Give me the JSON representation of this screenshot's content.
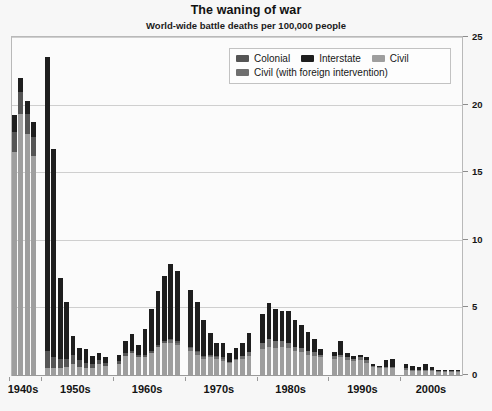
{
  "chart": {
    "title": "The waning of war",
    "subtitle": "World-wide battle deaths per 100,000 people"
  },
  "legend": {
    "rows": [
      [
        {
          "label": "Colonial",
          "color": "#555555",
          "key": "colonial"
        },
        {
          "label": "Interstate",
          "color": "#1e1e1e",
          "key": "interstate"
        },
        {
          "label": "Civil",
          "color": "#9e9e9e",
          "key": "civil"
        }
      ],
      [
        {
          "label": "Civil (with foreign intervention)",
          "color": "#6f6f6f",
          "key": "civil_foreign"
        }
      ]
    ]
  },
  "axes": {
    "y": {
      "min": 0,
      "max": 25,
      "ticks": [
        0,
        5,
        10,
        15,
        20,
        25
      ],
      "tick_labels": [
        "0",
        "5",
        "10",
        "15",
        "20",
        "25"
      ]
    },
    "x": {
      "tick_labels": [
        "1940s",
        "1950s",
        "1960s",
        "1970s",
        "1980s",
        "1990s",
        "2000s"
      ]
    }
  },
  "chart_data": {
    "type": "bar",
    "subtype": "stacked",
    "title": "The waning of war",
    "subtitle": "World-wide battle deaths per 100,000 people",
    "xlabel": "",
    "ylabel": "Battle deaths per 100,000 people",
    "ylim": [
      0,
      25
    ],
    "grid": true,
    "legend_position": "top-right-inside",
    "series": [
      {
        "name": "Colonial",
        "color": "#555555"
      },
      {
        "name": "Interstate",
        "color": "#1e1e1e"
      },
      {
        "name": "Civil",
        "color": "#9e9e9e"
      },
      {
        "name": "Civil (with foreign intervention)",
        "color": "#6f6f6f"
      }
    ],
    "categories": [
      "1946",
      "1947",
      "1948",
      "1949",
      "1950",
      "1951",
      "1952",
      "1953",
      "1954",
      "1955",
      "1956",
      "1957",
      "1958",
      "1959",
      "1960",
      "1961",
      "1962",
      "1963",
      "1964",
      "1965",
      "1966",
      "1967",
      "1968",
      "1969",
      "1970",
      "1971",
      "1972",
      "1973",
      "1974",
      "1975",
      "1976",
      "1977",
      "1978",
      "1979",
      "1980",
      "1981",
      "1982",
      "1983",
      "1984",
      "1985",
      "1986",
      "1987",
      "1988",
      "1989",
      "1990",
      "1991",
      "1992",
      "1993",
      "1994",
      "1995",
      "1996",
      "1997",
      "1998",
      "1999",
      "2000",
      "2001",
      "2002",
      "2003",
      "2004",
      "2005",
      "2006",
      "2007",
      "2008"
    ],
    "decade_groups": [
      {
        "label": "1940s",
        "start_index": 0,
        "count": 4
      },
      {
        "label": "1950s",
        "start_index": 4,
        "count": 10
      },
      {
        "label": "1960s",
        "start_index": 14,
        "count": 10
      },
      {
        "label": "1970s",
        "start_index": 24,
        "count": 10
      },
      {
        "label": "1980s",
        "start_index": 34,
        "count": 10
      },
      {
        "label": "1990s",
        "start_index": 44,
        "count": 10
      },
      {
        "label": "2000s",
        "start_index": 54,
        "count": 9
      }
    ],
    "values": {
      "colonial": [
        1.5,
        1.6,
        1.5,
        1.4,
        1.3,
        0.8,
        0.7,
        0.6,
        0.7,
        0.5,
        0.4,
        0.3,
        0.3,
        0.2,
        0.2,
        0.2,
        0.2,
        0.2,
        0.2,
        0.2,
        0.1,
        0.1,
        0.1,
        0.1,
        0.1,
        0.1,
        0.1,
        0.1,
        0.1,
        0.1,
        0,
        0,
        0,
        0,
        0,
        0,
        0,
        0,
        0,
        0,
        0,
        0,
        0,
        0,
        0,
        0,
        0,
        0,
        0,
        0,
        0,
        0,
        0,
        0,
        0,
        0,
        0,
        0,
        0
      ],
      "interstate": [
        1.2,
        1.1,
        1.0,
        1.1,
        21.7,
        15.4,
        6.0,
        4.2,
        1.4,
        0.9,
        1.0,
        0.6,
        0.5,
        0.4,
        0.5,
        0.9,
        1.2,
        0.7,
        1.9,
        3.1,
        4.0,
        4.8,
        5.5,
        5.2,
        4.2,
        3.6,
        2.7,
        1.6,
        1.0,
        1.1,
        0.6,
        0.8,
        1.0,
        1.4,
        2.1,
        2.6,
        2.4,
        2.2,
        2.3,
        2.0,
        1.7,
        1.4,
        1.0,
        0.4,
        0.3,
        1.0,
        0.3,
        0.2,
        0.2,
        0.2,
        0.1,
        0.1,
        0.5,
        0.6,
        0.3,
        0.3,
        0.2,
        0.4,
        0.2,
        0.1,
        0.1,
        0.1,
        0.1
      ],
      "civil": [
        16.5,
        19.3,
        17.8,
        16.2,
        0.5,
        0.5,
        0.5,
        0.6,
        0.8,
        0.6,
        0.5,
        0.5,
        0.8,
        0.7,
        0.8,
        1.4,
        1.6,
        1.3,
        1.3,
        1.6,
        2.1,
        2.4,
        2.4,
        2.2,
        1.8,
        1.5,
        1.2,
        1.3,
        1.2,
        1.0,
        0.9,
        1.1,
        1.2,
        1.4,
        1.9,
        2.1,
        2.0,
        2.1,
        2.0,
        1.8,
        1.7,
        1.5,
        1.4,
        1.3,
        1.2,
        1.3,
        1.1,
        1.0,
        1.1,
        0.9,
        0.6,
        0.5,
        0.5,
        0.5,
        0.4,
        0.3,
        0.3,
        0.3,
        0.3,
        0.2,
        0.2,
        0.2,
        0.2
      ],
      "civil_foreign": [
        0,
        0,
        0,
        0,
        0,
        0,
        0,
        0,
        0,
        0,
        0,
        0,
        0,
        0,
        0,
        0,
        0,
        0,
        0,
        0,
        0,
        0,
        0.2,
        0.2,
        0.2,
        0.2,
        0.1,
        0.1,
        0.1,
        0.2,
        0.1,
        0.1,
        0.2,
        0.3,
        0.5,
        0.6,
        0.5,
        0.4,
        0.4,
        0.3,
        0.3,
        0.3,
        0.3,
        0.2,
        0.2,
        0.2,
        0.2,
        0.2,
        0.2,
        0.2,
        0.1,
        0.1,
        0.1,
        0.1,
        0.1,
        0.1,
        0.1,
        0.1,
        0.1,
        0.1,
        0.1,
        0.1,
        0.1
      ]
    },
    "totals": [
      19.2,
      22.0,
      20.3,
      18.7,
      23.5,
      16.7,
      7.2,
      4.8,
      2.9,
      2.0,
      1.9,
      1.4,
      1.6,
      1.3,
      1.5,
      2.5,
      3.0,
      2.2,
      3.4,
      4.9,
      6.2,
      7.3,
      8.2,
      7.7,
      6.3,
      5.4,
      4.1,
      3.1,
      2.4,
      2.4,
      1.6,
      2.0,
      2.4,
      3.1,
      4.5,
      5.3,
      4.9,
      4.7,
      4.7,
      4.1,
      3.7,
      3.2,
      2.7,
      1.9,
      1.7,
      2.5,
      1.6,
      1.4,
      1.5,
      1.3,
      0.8,
      0.7,
      1.1,
      1.2,
      0.8,
      0.7,
      0.6,
      0.8,
      0.6,
      0.4,
      0.4,
      0.4,
      0.4
    ]
  }
}
